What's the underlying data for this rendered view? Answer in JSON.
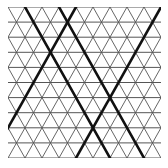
{
  "diagram": {
    "type": "triangular-grid",
    "background": "#ffffff",
    "grid_color": "#555555",
    "bold_color": "#111111",
    "bounds": {
      "x0": 8,
      "y0": 7,
      "x1": 161,
      "y1": 158
    },
    "rows": 10,
    "columns": 9,
    "cell_width": 17,
    "bold_lines": [
      {
        "from": [
          25,
          7
        ],
        "to": [
          110,
          158
        ]
      },
      {
        "from": [
          59,
          7
        ],
        "to": [
          144,
          158
        ]
      },
      {
        "from": [
          76,
          7
        ],
        "to": [
          -9,
          158
        ]
      },
      {
        "from": [
          161,
          7
        ],
        "to": [
          76,
          158
        ]
      }
    ]
  }
}
